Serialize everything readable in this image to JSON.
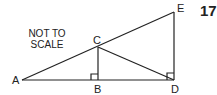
{
  "figure": {
    "number": "17",
    "note_line1": "NOT TO",
    "note_line2": "SCALE",
    "points": {
      "A": {
        "label": "A",
        "x": 22,
        "y": 80
      },
      "B": {
        "label": "B",
        "x": 98,
        "y": 80
      },
      "C": {
        "label": "C",
        "x": 98,
        "y": 47
      },
      "D": {
        "label": "D",
        "x": 174,
        "y": 80
      },
      "E": {
        "label": "E",
        "x": 174,
        "y": 12
      }
    },
    "segments": [
      "AD",
      "AE",
      "CB",
      "CD",
      "DE"
    ],
    "right_angles": [
      "B",
      "D"
    ],
    "stroke_color": "#222222"
  }
}
